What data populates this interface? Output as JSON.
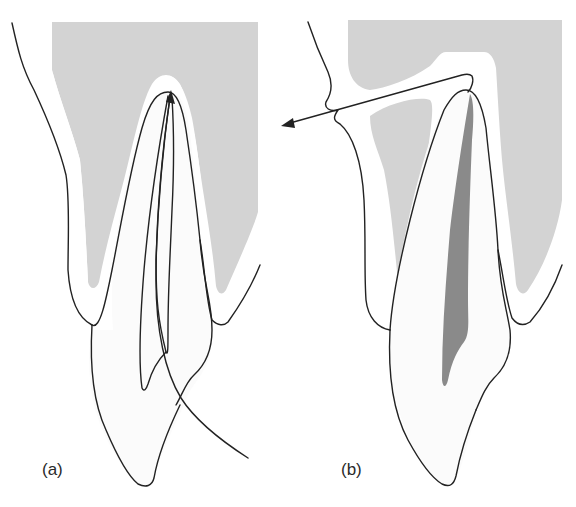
{
  "figure": {
    "colors": {
      "bone": "#d3d3d3",
      "pdl_space": "#ffffff",
      "tooth": "#fbfbfb",
      "pulp": "#8a8a8a",
      "outline": "#222222",
      "background": "#ffffff"
    },
    "panels": [
      {
        "id": "a",
        "label": "(a)",
        "elements": [
          "alveolar-bone",
          "lip-soft-tissue",
          "tooth-root-outline",
          "tooth-crown-outline",
          "curved-path-arrow-to-apex"
        ]
      },
      {
        "id": "b",
        "label": "(b)",
        "elements": [
          "alveolar-bone",
          "lip-soft-tissue",
          "tooth-outline",
          "pulp-canal",
          "straight-arrow-from-apex-outward"
        ]
      }
    ]
  }
}
